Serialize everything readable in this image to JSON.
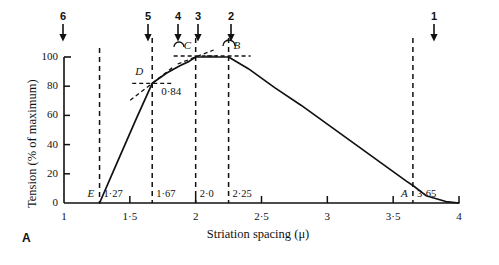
{
  "panel": {
    "label": "A"
  },
  "axes": {
    "x_title": "Striation spacing (μ)",
    "y_title": "Tension (% of maximum)",
    "x_ticks": [
      {
        "value": 1,
        "label": "1"
      },
      {
        "value": 1.5,
        "label": "1·5"
      },
      {
        "value": 2,
        "label": "2"
      },
      {
        "value": 2.5,
        "label": "2·5"
      },
      {
        "value": 3,
        "label": "3"
      },
      {
        "value": 3.5,
        "label": "3·5"
      },
      {
        "value": 4,
        "label": "4"
      }
    ],
    "y_ticks": [
      {
        "value": 0,
        "label": "0"
      },
      {
        "value": 20,
        "label": "20"
      },
      {
        "value": 40,
        "label": "40"
      },
      {
        "value": 60,
        "label": "60"
      },
      {
        "value": 80,
        "label": "80"
      },
      {
        "value": 100,
        "label": "100"
      }
    ],
    "xlim": [
      1,
      4
    ],
    "ylim": [
      0,
      105
    ]
  },
  "arrows": [
    {
      "number": "6",
      "x": 1.27
    },
    {
      "number": "5",
      "x": 1.925
    },
    {
      "number": "4",
      "x": 2.15
    },
    {
      "number": "3",
      "x": 2.3
    },
    {
      "number": "2",
      "x": 2.55
    },
    {
      "number": "1",
      "x": 4.05
    }
  ],
  "verticals": [
    {
      "x": 1.27,
      "value_label": "1·27",
      "point_label": "E"
    },
    {
      "x": 1.67,
      "value_label": "1·67",
      "point_label": "D"
    },
    {
      "x": 2.0,
      "value_label": "2·0",
      "point_label": "C"
    },
    {
      "x": 2.25,
      "value_label": "2·25",
      "point_label": "B"
    },
    {
      "x": 3.65,
      "value_label": "3·65",
      "point_label": "A"
    }
  ],
  "annotations": [
    {
      "text": "0·84",
      "kind": "slope"
    }
  ],
  "chart_data": {
    "type": "line",
    "title": "",
    "subtitle": "",
    "xlabel": "Striation spacing (μ)",
    "ylabel": "Tension (% of maximum)",
    "xlim": [
      1,
      4
    ],
    "ylim": [
      0,
      105
    ],
    "grid": false,
    "legend": null,
    "series": [
      {
        "name": "Tension vs striation spacing",
        "x": [
          1.27,
          1.4,
          1.55,
          1.67,
          1.78,
          1.88,
          1.95,
          2.0,
          2.1,
          2.2,
          2.25,
          2.4,
          2.6,
          2.8,
          3.0,
          3.2,
          3.4,
          3.6,
          3.65,
          3.75,
          3.9,
          4.0
        ],
        "values": [
          0,
          27,
          58,
          82,
          89,
          94,
          97,
          100,
          100,
          100,
          100,
          92,
          79,
          67,
          54,
          41,
          28,
          15,
          12,
          5,
          1,
          0
        ]
      }
    ],
    "key_points": [
      {
        "label": "E",
        "x": 1.27,
        "y": 0
      },
      {
        "label": "D",
        "x": 1.67,
        "y": 82
      },
      {
        "label": "C",
        "x": 2.0,
        "y": 100
      },
      {
        "label": "B",
        "x": 2.25,
        "y": 100
      },
      {
        "label": "A",
        "x": 3.65,
        "y": 0
      }
    ],
    "annotations": [
      {
        "text": "0·84",
        "description": "slope of ascending limb at D"
      }
    ],
    "marker_arrows": [
      "6",
      "5",
      "4",
      "3",
      "2",
      "1"
    ]
  },
  "style": {
    "ink": "#111111"
  }
}
